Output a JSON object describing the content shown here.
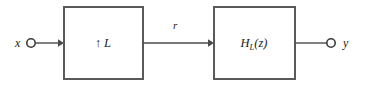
{
  "diagram": {
    "type": "signal-processing-block-diagram",
    "canvas": {
      "width": 365,
      "height": 89,
      "background": "#ffffff"
    },
    "colors": {
      "block_border": "#5a5a5a",
      "wire": "#4a4a4a",
      "text": "#1a1a1a",
      "block_fill": "#ffffff",
      "terminal_fill": "#ffffff",
      "terminal_border": "#3a3a3a"
    },
    "input": {
      "label": "x",
      "terminal_icon": "open-circle-terminal",
      "terminal": {
        "cx": 31,
        "cy": 43,
        "r": 4.2
      },
      "label_pos": {
        "x": 15,
        "y": 47
      },
      "wire": {
        "x1": 36,
        "y1": 43,
        "x2": 62,
        "y2": 43
      },
      "arrow": true
    },
    "blocks": [
      {
        "id": "upsampler",
        "label_arrow": "↑",
        "label_factor": "L",
        "label_full": "↑ L",
        "rect": {
          "x": 64,
          "y": 7,
          "width": 79,
          "height": 72
        },
        "label_pos": {
          "x": 103,
          "y": 47
        }
      },
      {
        "id": "filter",
        "label_base": "H",
        "label_subscript": "L",
        "label_suffix": "(z)",
        "label_full": "H_L(z)",
        "rect": {
          "x": 214,
          "y": 7,
          "width": 81,
          "height": 72
        },
        "label_pos": {
          "x": 254,
          "y": 47
        }
      }
    ],
    "intermediate_signal": {
      "label": "r",
      "label_pos": {
        "x": 173,
        "y": 29
      },
      "wire": {
        "x1": 143,
        "y1": 43,
        "x2": 212,
        "y2": 43
      },
      "arrow": true
    },
    "output": {
      "label": "y",
      "terminal_icon": "open-circle-terminal",
      "terminal": {
        "cx": 331,
        "cy": 43,
        "r": 4.2
      },
      "label_pos": {
        "x": 343,
        "y": 47
      },
      "wire": {
        "x1": 295,
        "y1": 43,
        "x2": 327,
        "y2": 43
      },
      "arrow": false
    }
  }
}
